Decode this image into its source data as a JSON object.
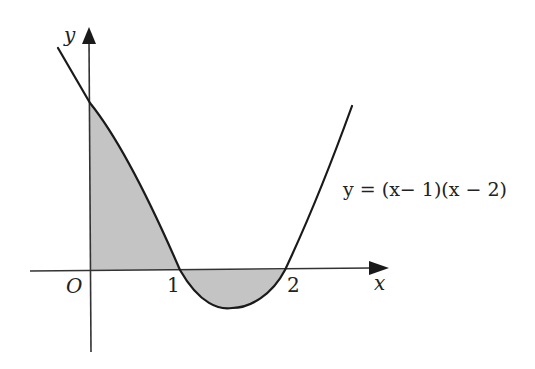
{
  "diagram": {
    "equation_label": "y = (x− 1)(x − 2)",
    "axes": {
      "x_label": "x",
      "y_label": "y",
      "origin_label": "O",
      "x_ticks": [
        "1",
        "2"
      ]
    },
    "shaded_regions": [
      {
        "name": "region-0-to-1",
        "description": "area between curve and axes from x=0 to x=1"
      },
      {
        "name": "region-1-to-2",
        "description": "area between x-axis and curve from x=1 to x=2 (below axis)"
      }
    ],
    "colors": {
      "curve": "#1a1a1a",
      "axis": "#333333",
      "shade": "#c4c4c4",
      "background": "#ffffff"
    }
  }
}
